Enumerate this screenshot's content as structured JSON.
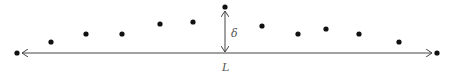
{
  "diagram": {
    "labels": {
      "length": "L",
      "deflection": "δ"
    },
    "colors": {
      "points": "#111111",
      "lines": "#444444",
      "text": "#555555"
    },
    "points": [
      {
        "id": "end-left",
        "role": "endpoint"
      },
      {
        "id": "p1",
        "role": "interior"
      },
      {
        "id": "p2",
        "role": "interior"
      },
      {
        "id": "p3",
        "role": "interior"
      },
      {
        "id": "p4",
        "role": "interior"
      },
      {
        "id": "p5",
        "role": "interior"
      },
      {
        "id": "peak",
        "role": "apex"
      },
      {
        "id": "p6",
        "role": "interior"
      },
      {
        "id": "p7",
        "role": "interior"
      },
      {
        "id": "p8",
        "role": "interior"
      },
      {
        "id": "p9",
        "role": "interior"
      },
      {
        "id": "p10",
        "role": "interior"
      },
      {
        "id": "end-right",
        "role": "endpoint"
      }
    ]
  }
}
